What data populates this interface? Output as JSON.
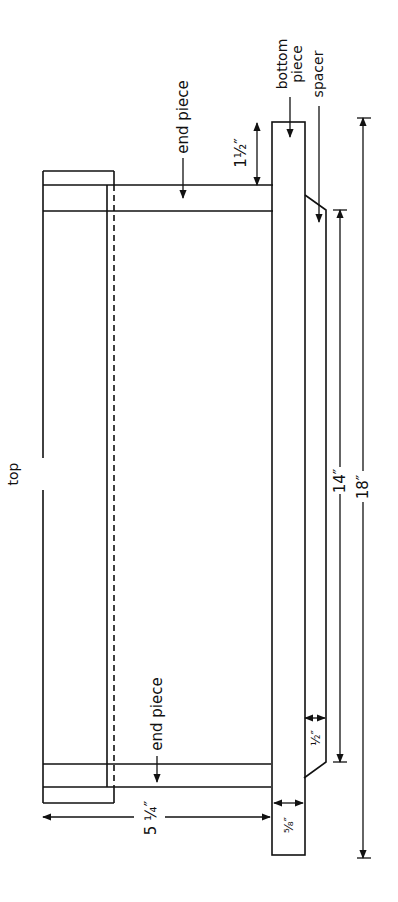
{
  "diagram": {
    "type": "technical-drawing",
    "colors": {
      "line": "#111111",
      "background": "#ffffff"
    },
    "labels": {
      "top": "top",
      "end_piece_top": "end piece",
      "end_piece_bottom": "end piece",
      "bottom_piece_line1": "bottom",
      "bottom_piece_line2": "piece",
      "spacer": "spacer"
    },
    "dimensions": {
      "height_total": "5 ¼″",
      "end_offset": "1½″",
      "bottom_thickness": "⁵⁄₈″",
      "spacer_thickness": "½″",
      "spacer_length": "14″",
      "overall_length": "18″"
    }
  }
}
